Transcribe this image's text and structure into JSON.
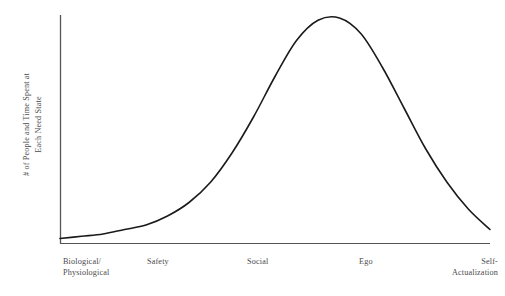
{
  "chart_data": {
    "type": "line",
    "title": "",
    "subtitle": "",
    "ylabel_line1": "# of People and Time Spent at",
    "ylabel_line2": "Each Need State",
    "xlabel": "",
    "grid": false,
    "legend": "none",
    "axis_color": "#555555",
    "curve_color": "#1a1a1a",
    "background_color": "#ffffff",
    "categories": [
      "Biological/ Physiological",
      "Safety",
      "Social",
      "Ego",
      "Self- Actualization"
    ],
    "tick_labels": [
      {
        "line1": "Biological/",
        "line2": "Physiological"
      },
      {
        "line1": "Safety",
        "line2": ""
      },
      {
        "line1": "Social",
        "line2": ""
      },
      {
        "line1": "Ego",
        "line2": ""
      },
      {
        "line1": "Self-",
        "line2": "Actualization"
      }
    ],
    "series": [
      {
        "name": "# of People and Time Spent at Each Need State",
        "x": [
          0,
          5,
          10,
          15,
          20,
          25,
          30,
          35,
          40,
          45,
          50,
          55,
          60,
          65,
          70,
          75,
          80,
          85,
          90,
          95,
          100
        ],
        "values": [
          2,
          3,
          4,
          6,
          8,
          12,
          18,
          27,
          40,
          56,
          74,
          90,
          99,
          100,
          93,
          78,
          60,
          42,
          27,
          15,
          6
        ]
      }
    ],
    "xlim": [
      0,
      100
    ],
    "ylim": [
      0,
      100
    ],
    "peak_category": "Social",
    "peak_value": 100,
    "shape": "bell-curve"
  }
}
